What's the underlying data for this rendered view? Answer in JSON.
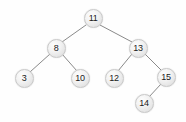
{
  "figure": {
    "kind": "binary-search-tree-diagram",
    "background_color": "#fefefe",
    "node_fill_color": "#eeeeee",
    "node_border_color": "#c9c9c9",
    "node_text_color": "#1a1a1a",
    "edge_color": "#8a8a8a"
  },
  "nodes": [
    {
      "id": "n11",
      "label": "11",
      "x": 93,
      "y": 18,
      "depth": 0
    },
    {
      "id": "n8",
      "label": "8",
      "x": 56,
      "y": 48,
      "depth": 1
    },
    {
      "id": "n13",
      "label": "13",
      "x": 138,
      "y": 48,
      "depth": 1
    },
    {
      "id": "n3",
      "label": "3",
      "x": 24,
      "y": 78,
      "depth": 2
    },
    {
      "id": "n10",
      "label": "10",
      "x": 80,
      "y": 78,
      "depth": 2
    },
    {
      "id": "n12",
      "label": "12",
      "x": 114,
      "y": 78,
      "depth": 2
    },
    {
      "id": "n15",
      "label": "15",
      "x": 166,
      "y": 77,
      "depth": 2
    },
    {
      "id": "n14",
      "label": "14",
      "x": 144,
      "y": 103,
      "depth": 3
    }
  ],
  "edges": [
    {
      "from": "n11",
      "to": "n8",
      "x1": 86,
      "y1": 25,
      "x2": 62,
      "y2": 42
    },
    {
      "from": "n11",
      "to": "n13",
      "x1": 100,
      "y1": 25,
      "x2": 132,
      "y2": 42
    },
    {
      "from": "n8",
      "to": "n3",
      "x1": 50,
      "y1": 54,
      "x2": 30,
      "y2": 72
    },
    {
      "from": "n8",
      "to": "n10",
      "x1": 62,
      "y1": 54,
      "x2": 77,
      "y2": 71
    },
    {
      "from": "n13",
      "to": "n12",
      "x1": 132,
      "y1": 54,
      "x2": 118,
      "y2": 71
    },
    {
      "from": "n13",
      "to": "n15",
      "x1": 145,
      "y1": 54,
      "x2": 161,
      "y2": 70
    },
    {
      "from": "n15",
      "to": "n14",
      "x1": 161,
      "y1": 84,
      "x2": 149,
      "y2": 97
    }
  ]
}
